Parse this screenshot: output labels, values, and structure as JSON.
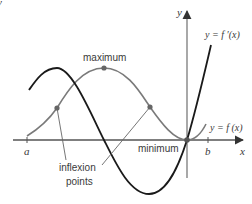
{
  "diagram": {
    "axes": {
      "x_label": "x",
      "y_label": "y",
      "x_ticks": [
        {
          "label": "a",
          "px": 27
        },
        {
          "label": "b",
          "px": 208
        }
      ],
      "origin_px": [
        187,
        140
      ]
    },
    "curves": [
      {
        "name": "f",
        "label": "y = f (x)",
        "color": "#7a7a7a"
      },
      {
        "name": "f_prime",
        "label": "y = f ′(x)",
        "color": "#1a1a1a"
      }
    ],
    "annotations": {
      "maximum": "maximum",
      "minimum": "minimum",
      "inflexion_line1": "inflexion",
      "inflexion_line2": "points"
    },
    "points": {
      "maximum": [
        104,
        68
      ],
      "inflexion_left": [
        57,
        108
      ],
      "inflexion_right": [
        150,
        107
      ],
      "minimum": [
        187,
        140
      ]
    },
    "colors": {
      "axis": "#7a7a7a",
      "f_curve": "#7a7a7a",
      "f_prime_curve": "#1a1a1a",
      "points": "#666666",
      "text": "#3a3a3a"
    },
    "top_left_fragment": "y"
  }
}
